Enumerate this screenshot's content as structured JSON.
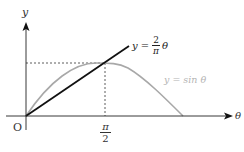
{
  "diagram": {
    "axes": {
      "x_label": "θ",
      "y_label": "y",
      "origin_label": "O"
    },
    "tick": {
      "numerator": "π",
      "denominator": "2"
    },
    "line_label": {
      "lhs": "y",
      "eq": "=",
      "frac_num": "2",
      "frac_den": "π",
      "var": "θ"
    },
    "curve_label": "y = sin θ",
    "colors": {
      "axis": "#222222",
      "line": "#111111",
      "curve": "#a8a8a8",
      "curve_label": "#b4b4b4",
      "dashed": "#333333"
    }
  }
}
